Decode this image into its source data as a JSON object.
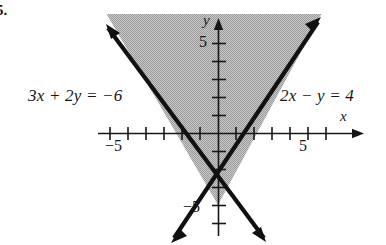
{
  "exercise": {
    "number": "5."
  },
  "figure": {
    "type": "cartesian-graph",
    "axes": {
      "x_label": "x",
      "y_label": "y",
      "x_tick_labels": [
        {
          "value": -5,
          "text": "−5"
        },
        {
          "value": 5,
          "text": "5"
        }
      ],
      "y_tick_labels": [
        {
          "value": 5,
          "text": "5"
        },
        {
          "value": -5,
          "text": "−5"
        }
      ],
      "x_range": [
        -7.2,
        7.0
      ],
      "y_range": [
        -6.4,
        6.2
      ],
      "tick_step": 1,
      "grid": false,
      "origin_px": [
        218,
        133
      ],
      "unit_px": 18
    },
    "lines": [
      {
        "label": "3x + 2y = −6",
        "slope": -1.5,
        "intercept": -3,
        "style": "solid",
        "arrows": "both"
      },
      {
        "label": "2x − y = 4",
        "slope": 2,
        "intercept": -4,
        "style": "solid",
        "arrows": "both"
      }
    ],
    "shading": {
      "description": "region above both lines (interior of the upward V)",
      "pattern": "gray-dither",
      "color": "#b4b4b4"
    },
    "labels": {
      "left_equation": "3x + 2y = −6",
      "right_equation": "2x − y = 4"
    },
    "colors": {
      "ink": "#171717",
      "line": "#111111",
      "shade": "#b4b4b4",
      "background": "#ffffff"
    }
  }
}
